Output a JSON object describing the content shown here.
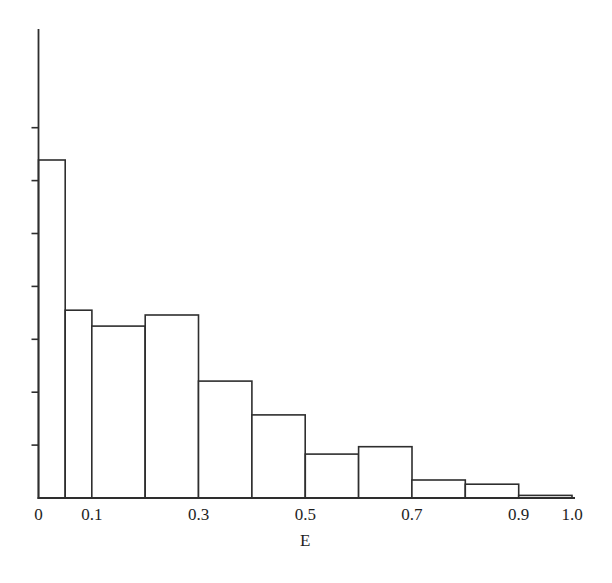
{
  "figure": {
    "background_color": "#ffffff",
    "line_color": "#2e2e2e",
    "text_color": "#1e1e1e"
  },
  "chart_data": {
    "type": "bar",
    "subtype": "histogram",
    "title": "",
    "xlabel": "E",
    "ylabel": "",
    "x_axis": {
      "range": [
        0,
        1.0
      ],
      "tick_values": [
        0,
        0.1,
        0.3,
        0.5,
        0.7,
        0.9,
        1.0
      ],
      "tick_labels": [
        "0",
        "0.1",
        "0.3",
        "0.5",
        "0.7",
        "0.9",
        "1.0"
      ]
    },
    "y_axis": {
      "labels_shown": false,
      "num_ticks": 7,
      "tick_side": "left",
      "note": "y-axis has evenly spaced unlabeled tick marks; bar heights below are in tick units"
    },
    "bins": [
      {
        "from": 0.0,
        "to": 0.05,
        "height": 6.39
      },
      {
        "from": 0.05,
        "to": 0.1,
        "height": 3.55
      },
      {
        "from": 0.1,
        "to": 0.2,
        "height": 3.25
      },
      {
        "from": 0.2,
        "to": 0.3,
        "height": 3.46
      },
      {
        "from": 0.3,
        "to": 0.4,
        "height": 2.21
      },
      {
        "from": 0.4,
        "to": 0.5,
        "height": 1.57
      },
      {
        "from": 0.5,
        "to": 0.6,
        "height": 0.83
      },
      {
        "from": 0.6,
        "to": 0.7,
        "height": 0.97
      },
      {
        "from": 0.7,
        "to": 0.8,
        "height": 0.34
      },
      {
        "from": 0.8,
        "to": 0.9,
        "height": 0.26
      },
      {
        "from": 0.9,
        "to": 1.0,
        "height": 0.05
      }
    ],
    "grid": false,
    "legend": false
  }
}
